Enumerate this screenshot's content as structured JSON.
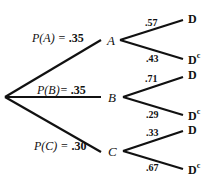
{
  "diagram": {
    "type": "probability-tree",
    "line_color": "#111111",
    "first_stage": [
      {
        "event": "A",
        "prob_text": "P(A) = ",
        "prob_value": ".35"
      },
      {
        "event": "B",
        "prob_text": "P(B)= ",
        "prob_value": ".35"
      },
      {
        "event": "C",
        "prob_text": "P(C) = ",
        "prob_value": ".30"
      }
    ],
    "second_stage": {
      "A": [
        {
          "outcome": "D",
          "superscript": "",
          "prob": ".57"
        },
        {
          "outcome": "D",
          "superscript": "c",
          "prob": ".43"
        }
      ],
      "B": [
        {
          "outcome": "D",
          "superscript": "",
          "prob": ".71"
        },
        {
          "outcome": "D",
          "superscript": "c",
          "prob": ".29"
        }
      ],
      "C": [
        {
          "outcome": "D",
          "superscript": "",
          "prob": ".33"
        },
        {
          "outcome": "D",
          "superscript": "c",
          "prob": ".67"
        }
      ]
    }
  }
}
